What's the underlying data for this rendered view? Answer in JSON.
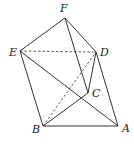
{
  "figure": {
    "type": "geometric-solid",
    "vertices": {
      "A": {
        "label": "A",
        "x": 118,
        "y": 126,
        "lx": 122,
        "ly": 132
      },
      "B": {
        "label": "B",
        "x": 43,
        "y": 126,
        "lx": 32,
        "ly": 133
      },
      "C": {
        "label": "C",
        "x": 88,
        "y": 93,
        "lx": 92,
        "ly": 97
      },
      "D": {
        "label": "D",
        "x": 96,
        "y": 52,
        "lx": 100,
        "ly": 56
      },
      "E": {
        "label": "E",
        "x": 20,
        "y": 51,
        "lx": 9,
        "ly": 56
      },
      "F": {
        "label": "F",
        "x": 65,
        "y": 18,
        "lx": 60,
        "ly": 12
      }
    },
    "solid_edges": [
      [
        "F",
        "E"
      ],
      [
        "F",
        "D"
      ],
      [
        "F",
        "C"
      ],
      [
        "E",
        "B"
      ],
      [
        "E",
        "A"
      ],
      [
        "D",
        "C"
      ],
      [
        "D",
        "A"
      ],
      [
        "C",
        "B"
      ],
      [
        "B",
        "A"
      ]
    ],
    "dashed_edges": [
      [
        "E",
        "D"
      ],
      [
        "B",
        "D"
      ]
    ]
  }
}
